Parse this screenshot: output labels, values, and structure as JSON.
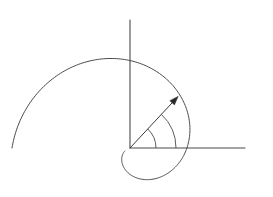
{
  "figure": {
    "background_color": "#ffffff",
    "line_color": "#4a4a4a",
    "label_color": "#2b2b2b"
  },
  "axes": {
    "x_axis": {
      "label": "x",
      "icon_name": "x-axis-line",
      "origin": {
        "x": 130,
        "y": 148
      },
      "end": {
        "x": 245,
        "y": 148
      }
    },
    "y_axis": {
      "label": "y",
      "icon_name": "y-axis-line",
      "origin": {
        "x": 130,
        "y": 148
      },
      "end": {
        "x": 130,
        "y": 20
      }
    }
  },
  "vector": {
    "label": "r",
    "icon_name": "radius-vector-arrow",
    "start": {
      "x": 130,
      "y": 148
    },
    "tip": {
      "x": 178,
      "y": 96
    },
    "angle_degrees": 47
  },
  "angle": {
    "label": "ϕ",
    "icon_name": "angle-arc",
    "name": "phi",
    "from_degrees": 0,
    "to_degrees": 47,
    "arc_radii": [
      26,
      46
    ]
  },
  "chart_data": {
    "type": "line",
    "xlabel": "x",
    "ylabel": "y",
    "curve_name": "spiral",
    "polar_equation": "r = a·φ",
    "origin_px": {
      "x": 130,
      "y": 148
    },
    "theta_start_degrees": -150,
    "theta_end_degrees": 180,
    "r_start_px": 6,
    "r_end_px": 118,
    "key_points_px": [
      {
        "x": 130,
        "y": 148
      },
      {
        "x": 163,
        "y": 176
      },
      {
        "x": 190,
        "y": 148
      },
      {
        "x": 175,
        "y": 99
      },
      {
        "x": 130,
        "y": 63
      },
      {
        "x": 60,
        "y": 72
      },
      {
        "x": 22,
        "y": 120
      },
      {
        "x": 15,
        "y": 150
      }
    ],
    "grid": false,
    "legend": "none"
  }
}
